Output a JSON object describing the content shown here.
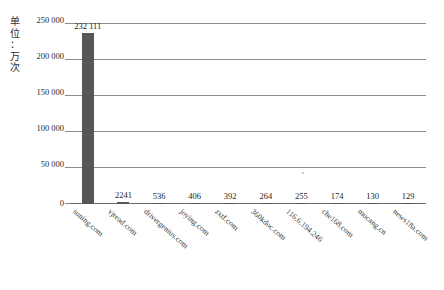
{
  "chart_data": {
    "type": "bar",
    "title": "",
    "xlabel": "",
    "ylabel": "单位：万次",
    "ylim": [
      0,
      250000
    ],
    "yticks": [
      0,
      50000,
      100000,
      150000,
      200000,
      250000
    ],
    "ytick_labels": [
      "0",
      "50 000",
      "100 000",
      "150 000",
      "200 000",
      "250 000"
    ],
    "grid": true,
    "legend": "none",
    "categories": [
      "suning.com",
      "vjread.com",
      "drivergenius.com",
      "joying.com",
      "zxtf.com",
      "360kdoc.com",
      "116.6.194.246",
      "che168.com",
      "mucang.cn",
      "news18a.com"
    ],
    "values": [
      232111,
      2241,
      536,
      406,
      392,
      264,
      255,
      174,
      130,
      129
    ],
    "value_labels": [
      "232 111",
      "2241",
      "536",
      "406",
      "392",
      "264",
      "255",
      "174",
      "130",
      "129"
    ],
    "bar_color": "#575757"
  },
  "axis": {
    "unit_caption": "单\n位\n：\n万\n次"
  },
  "caption": {
    "text": ""
  }
}
